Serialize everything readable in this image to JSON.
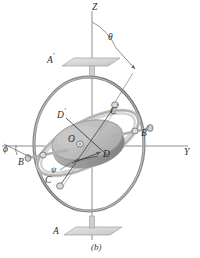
{
  "figure": {
    "caption": "(b)",
    "kind": "gyroscope-gimbal-diagram",
    "colors": {
      "axis_line": "#8a8a8a",
      "outer_gimbal": "#7d7d7d",
      "inner_gimbal": "#b9b9b9",
      "rotor_top": "#c9c9c9",
      "rotor_side": "#9d9d9d",
      "plate": "#d8d8d8",
      "label": "#2b2b2b",
      "leader": "#6e6e6e"
    },
    "labels": [
      {
        "id": "axis-z",
        "text": "Z",
        "base": "Z",
        "prime": "",
        "x": 92,
        "y": 4,
        "size": "sz9"
      },
      {
        "id": "axis-y",
        "text": "Y",
        "base": "Y",
        "prime": "",
        "x": 186,
        "y": 148,
        "size": "sz9"
      },
      {
        "id": "angle-theta",
        "text": "θ",
        "base": "θ",
        "prime": "",
        "x": 109,
        "y": 36,
        "size": "sz9"
      },
      {
        "id": "angle-phi",
        "text": "ϕ",
        "base": "ϕ",
        "prime": "",
        "x": 4,
        "y": 147,
        "size": "sz9"
      },
      {
        "id": "angle-psi",
        "text": "ψ",
        "base": "ψ",
        "prime": "",
        "x": 51,
        "y": 166,
        "size": "sz8"
      },
      {
        "id": "bearing-a-top",
        "text": "A'",
        "base": "A",
        "prime": "′",
        "x": 48,
        "y": 55,
        "size": "sz9"
      },
      {
        "id": "bearing-a-bot",
        "text": "A",
        "base": "A",
        "prime": "",
        "x": 53,
        "y": 228,
        "size": "sz9"
      },
      {
        "id": "bearing-b",
        "text": "B",
        "base": "B",
        "prime": "",
        "x": 18,
        "y": 158,
        "size": "sz9"
      },
      {
        "id": "bearing-b-p",
        "text": "B'",
        "base": "B",
        "prime": "′",
        "x": 140,
        "y": 128,
        "size": "sz9"
      },
      {
        "id": "bearing-c",
        "text": "C",
        "base": "C",
        "prime": "",
        "x": 45,
        "y": 176,
        "size": "sz9"
      },
      {
        "id": "bearing-c-p",
        "text": "C'",
        "base": "C",
        "prime": "′",
        "x": 110,
        "y": 106,
        "size": "sz9"
      },
      {
        "id": "point-d",
        "text": "D",
        "base": "D",
        "prime": "",
        "x": 102,
        "y": 150,
        "size": "sz9"
      },
      {
        "id": "point-d-p",
        "text": "D'",
        "base": "D",
        "prime": "′",
        "x": 58,
        "y": 110,
        "size": "sz9"
      },
      {
        "id": "origin-o",
        "text": "O",
        "base": "O",
        "prime": "",
        "x": 68,
        "y": 136,
        "size": "sz9"
      }
    ],
    "geometry": {
      "center": [
        88,
        143
      ],
      "outer_gimbal_rx": 55,
      "outer_gimbal_ry": 67,
      "rotor_rx": 36,
      "rotor_ry": 19,
      "rotor_thickness": 13,
      "rotor_tilt_deg": -14,
      "inner_gimbal_tilt_deg": -30,
      "z_axis_top": 10,
      "z_axis_bottom": 240,
      "y_axis_left": 0,
      "y_axis_right": 190
    }
  }
}
